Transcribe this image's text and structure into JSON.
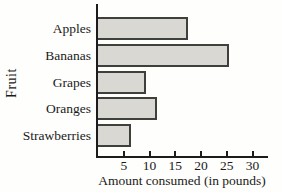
{
  "chart_data": {
    "type": "bar",
    "orientation": "horizontal",
    "title": "",
    "categories": [
      "Apples",
      "Bananas",
      "Grapes",
      "Oranges",
      "Strawberries"
    ],
    "values": [
      17,
      25,
      9,
      11,
      6
    ],
    "xlabel": "Amount consumed (in pounds)",
    "ylabel": "Fruit",
    "x_ticks": [
      5,
      10,
      15,
      20,
      25,
      30
    ],
    "xlim": [
      0,
      33
    ],
    "grid": false,
    "legend": false,
    "bar_fill_color": "#d9d8d2",
    "bar_border_color": "#3f3f3c",
    "axis_color": "#1c1c1c",
    "text_color": "#1a1a1a",
    "background_color": "#fefefc"
  }
}
